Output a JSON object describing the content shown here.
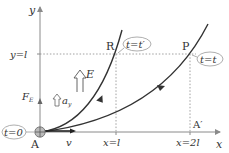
{
  "diagram": {
    "axes": {
      "x_label": "x",
      "y_label": "y"
    },
    "origin": {
      "label": "A",
      "time_tag": "t=0"
    },
    "reference_lines": {
      "y_l": "y=l",
      "x_l": "x=l",
      "x_2l": "x=2l"
    },
    "points": {
      "R": {
        "label": "R",
        "time_tag": "t=t′"
      },
      "P": {
        "label": "P",
        "time_tag": "t=t"
      },
      "A_prime": {
        "label": "A′"
      }
    },
    "vectors": {
      "field": "E",
      "force": "F",
      "force_sub": "E",
      "accel": "a",
      "accel_sub": "y",
      "velocity": "v"
    },
    "colors": {
      "axis": "#8a8a8a",
      "curve": "#333333",
      "dotted": "#888888",
      "tag_border": "#999999"
    }
  }
}
